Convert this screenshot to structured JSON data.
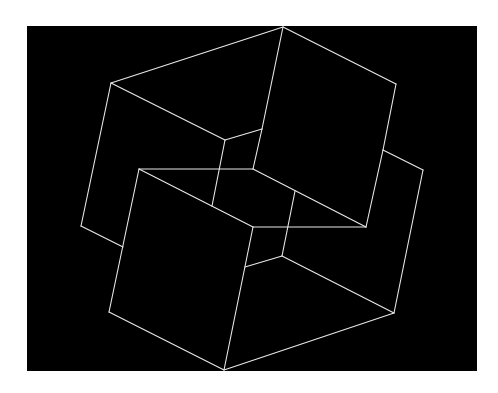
{
  "figure": {
    "background_color": "#ffffff",
    "panel_color": "#000000",
    "line_color": "#e8e8e8",
    "line_width": 1.1,
    "panel": {
      "x": 27,
      "y": 26,
      "width": 450,
      "height": 345
    }
  },
  "shapes": {
    "description": "Two interlocking wireframe cubes (line drawing)",
    "segments": [
      {
        "name": "upper-cube-top-left-edge",
        "from": [
          111,
          83
        ],
        "to": [
          283,
          27
        ]
      },
      {
        "name": "upper-cube-top-right-edge",
        "from": [
          283,
          27
        ],
        "to": [
          396,
          84
        ]
      },
      {
        "name": "upper-cube-right-edge",
        "from": [
          396,
          84
        ],
        "to": [
          383,
          150
        ]
      },
      {
        "name": "upper-cube-left-edge",
        "from": [
          111,
          83
        ],
        "to": [
          81,
          226
        ]
      },
      {
        "name": "upper-cube-bottom-left-edge",
        "from": [
          81,
          226
        ],
        "to": [
          123,
          247
        ]
      },
      {
        "name": "upper-cube-inner-diagonal",
        "from": [
          111,
          83
        ],
        "to": [
          225,
          140
        ]
      },
      {
        "name": "upper-cube-inner-short",
        "from": [
          225,
          140
        ],
        "to": [
          262,
          129
        ]
      },
      {
        "name": "upper-cube-center-vertical",
        "from": [
          283,
          27
        ],
        "to": [
          262,
          129
        ]
      },
      {
        "name": "upper-cube-inner-vertical-lower",
        "from": [
          262,
          129
        ],
        "to": [
          253,
          169
        ]
      },
      {
        "name": "upper-cube-hidden-vertical",
        "from": [
          225,
          140
        ],
        "to": [
          212,
          206
        ]
      },
      {
        "name": "lower-right-vertical",
        "from": [
          383,
          150
        ],
        "to": [
          366,
          227
        ]
      },
      {
        "name": "right-cube-top-edge",
        "from": [
          383,
          150
        ],
        "to": [
          423,
          170
        ]
      },
      {
        "name": "right-cube-right-edge",
        "from": [
          423,
          170
        ],
        "to": [
          394,
          313
        ]
      },
      {
        "name": "center-diagonal",
        "from": [
          253,
          169
        ],
        "to": [
          366,
          227
        ]
      },
      {
        "name": "lower-cube-top-edge",
        "from": [
          139,
          169
        ],
        "to": [
          253,
          169
        ]
      },
      {
        "name": "lower-cube-upper-diagonal",
        "from": [
          139,
          169
        ],
        "to": [
          253,
          227
        ]
      },
      {
        "name": "lower-cube-mid-horizontal",
        "from": [
          253,
          227
        ],
        "to": [
          366,
          227
        ]
      },
      {
        "name": "lower-cube-left-edge",
        "from": [
          139,
          169
        ],
        "to": [
          109,
          312
        ]
      },
      {
        "name": "lower-cube-bottom-left-edge",
        "from": [
          109,
          312
        ],
        "to": [
          224,
          370
        ]
      },
      {
        "name": "lower-cube-front-vertical",
        "from": [
          253,
          227
        ],
        "to": [
          224,
          370
        ]
      },
      {
        "name": "lower-cube-bottom-right-edge",
        "from": [
          224,
          370
        ],
        "to": [
          394,
          313
        ]
      },
      {
        "name": "inner-short-edge",
        "from": [
          245,
          267
        ],
        "to": [
          282,
          256
        ]
      },
      {
        "name": "inner-vertical",
        "from": [
          295,
          191
        ],
        "to": [
          282,
          256
        ]
      },
      {
        "name": "inner-diagonal-to-corner",
        "from": [
          282,
          256
        ],
        "to": [
          394,
          313
        ]
      }
    ]
  }
}
